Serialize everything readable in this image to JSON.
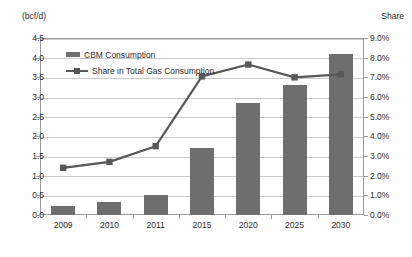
{
  "chart_data": {
    "type": "bar",
    "title": "",
    "subtitle": "",
    "categories": [
      "2009",
      "2010",
      "2011",
      "2015",
      "2020",
      "2025",
      "2030"
    ],
    "series": [
      {
        "name": "CBM Consumption",
        "type": "bar",
        "axis": "left",
        "values": [
          0.23,
          0.33,
          0.52,
          1.7,
          2.85,
          3.3,
          4.1
        ],
        "color": "#6e6e6e"
      },
      {
        "name": "Share in Total Gas Consumption",
        "type": "line",
        "axis": "right",
        "values": [
          2.4,
          2.7,
          3.5,
          7.05,
          7.65,
          7.0,
          7.15
        ],
        "color": "#585858"
      }
    ],
    "xlabel": "",
    "ylabel": "(bcf/d)",
    "ylabel_secondary": "Share",
    "ylim": [
      0.0,
      4.5
    ],
    "ylim_secondary": [
      0.0,
      9.0
    ],
    "yticks": [
      "0.0",
      "0.5",
      "1.0",
      "1.5",
      "2.0",
      "2.5",
      "3.0",
      "3.5",
      "4.0",
      "4.5"
    ],
    "yticks_secondary": [
      "0.0%",
      "1.0%",
      "2.0%",
      "3.0%",
      "4.0%",
      "5.0%",
      "6.0%",
      "7.0%",
      "8.0%",
      "9.0%"
    ],
    "grid": true,
    "legend_position": "inside-top-left"
  },
  "axes": {
    "left_title": "(bcf/d)",
    "right_title": "Share"
  },
  "legend": {
    "items": [
      {
        "label": "CBM Consumption",
        "marker": "bar-swatch"
      },
      {
        "label": "Share in Total Gas Consumption",
        "marker": "line-square-marker"
      }
    ]
  }
}
